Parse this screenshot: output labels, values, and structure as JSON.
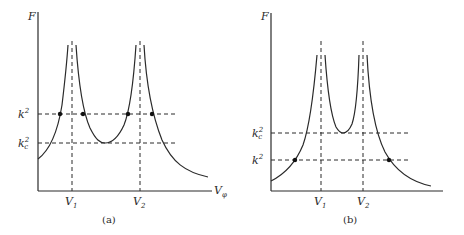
{
  "panels": [
    {
      "caption": "(a)",
      "y_label": "F",
      "x_label": "V",
      "x_label_sub": "φ",
      "v1_label": "V",
      "v1_sub": "1",
      "v2_label": "V",
      "v2_sub": "2",
      "k2_label": "k",
      "k2_sup": "2",
      "kc2_label": "k",
      "kc2_sub": "c",
      "kc2_sup": "2",
      "note": "k² above kc²; four intersection points marked"
    },
    {
      "caption": "(b)",
      "y_label": "F",
      "v1_label": "V",
      "v1_sub": "1",
      "v2_label": "V",
      "v2_sub": "2",
      "k2_label": "k",
      "k2_sup": "2",
      "kc2_label": "k",
      "kc2_sub": "c",
      "kc2_sup": "2",
      "note": "k² below kc²; two intersection points marked"
    }
  ]
}
